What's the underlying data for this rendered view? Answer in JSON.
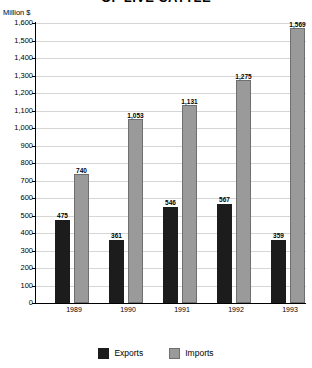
{
  "chart_data": {
    "type": "bar",
    "title": "OF LIVE CATTLE",
    "subtitle": "",
    "xlabel": "",
    "ylabel": "Million $",
    "ylim": [
      0,
      1600
    ],
    "ytick_step": 100,
    "grid": true,
    "legend_position": "bottom",
    "categories": [
      "1989",
      "1990",
      "1991",
      "1992",
      "1993"
    ],
    "series": [
      {
        "name": "Exports",
        "color": "#1c1c1c",
        "values": [
          475,
          361,
          546,
          567,
          359
        ],
        "labels": [
          "475",
          "361",
          "546",
          "567",
          "359"
        ]
      },
      {
        "name": "Imports",
        "color": "#9a9a9a",
        "values": [
          740,
          1053,
          1131,
          1275,
          1569
        ],
        "labels": [
          "740",
          "1,053",
          "1,131",
          "1,275",
          "1,569"
        ]
      }
    ],
    "ytick_labels": [
      "0",
      "100",
      "200",
      "300",
      "400",
      "500",
      "600",
      "700",
      "800",
      "900",
      "1,000",
      "1,100",
      "1,200",
      "1,300",
      "1,400",
      "1,500",
      "1,600"
    ]
  }
}
